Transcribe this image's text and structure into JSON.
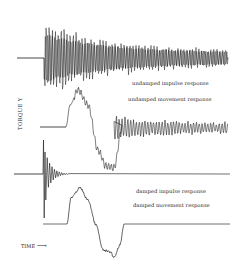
{
  "chart_data": {
    "type": "line",
    "title": "",
    "xlabel": "TIME",
    "ylabel": "TORQUE Y",
    "grid": false,
    "legend_position": "inline labels beside each trace",
    "series": [
      {
        "name": "undamped impulse response",
        "baseline_y_px": 58,
        "flat_until_x_px": 44,
        "description": "flat line then sharp onset of high-frequency oscillation with slowly decaying amplitude persisting to end",
        "initial_amplitude_px": 38,
        "final_amplitude_px": 8,
        "end_x_px": 228
      },
      {
        "name": "undamped movement response",
        "baseline_y_px": 127,
        "flat_until_x_px": 66,
        "description": "flat, rises to positive peak, swings to negative trough, returns to baseline with persistent decaying oscillation",
        "keypoints_px": [
          [
            40,
            127
          ],
          [
            66,
            127
          ],
          [
            70,
            105
          ],
          [
            78,
            90
          ],
          [
            88,
            105
          ],
          [
            98,
            150
          ],
          [
            106,
            166
          ],
          [
            114,
            168
          ],
          [
            122,
            128
          ],
          [
            228,
            129
          ]
        ],
        "residual_amplitude_px": [
          12,
          5
        ]
      },
      {
        "name": "damped impulse response",
        "baseline_y_px": 174,
        "flat_until_x_px": 43,
        "description": "sharp spike with rapidly decaying ringing then flat line",
        "spike_range_px": [
          140,
          218
        ],
        "end_x_px": 230
      },
      {
        "name": "damped movement response",
        "baseline_y_px": 224,
        "flat_until_x_px": 67,
        "description": "flat, smooth rise to positive peak, descent to negative trough, clean return to flat baseline",
        "keypoints_px": [
          [
            43,
            224
          ],
          [
            67,
            224
          ],
          [
            71,
            198
          ],
          [
            80,
            188
          ],
          [
            88,
            200
          ],
          [
            96,
            225
          ],
          [
            103,
            250
          ],
          [
            110,
            252
          ],
          [
            114,
            257
          ],
          [
            120,
            245
          ],
          [
            124,
            224
          ],
          [
            230,
            224
          ]
        ]
      }
    ]
  },
  "labels": {
    "undamped_impulse": "undamped impulse response",
    "undamped_movement": "undamped movement response",
    "damped_impulse": "damped impulse response",
    "damped_movement": "damped movement response",
    "y_axis": "TORQUE Y",
    "x_axis": "TIME",
    "x_arrow": "⟶",
    "caption": "Figure — (caption cut off)"
  }
}
